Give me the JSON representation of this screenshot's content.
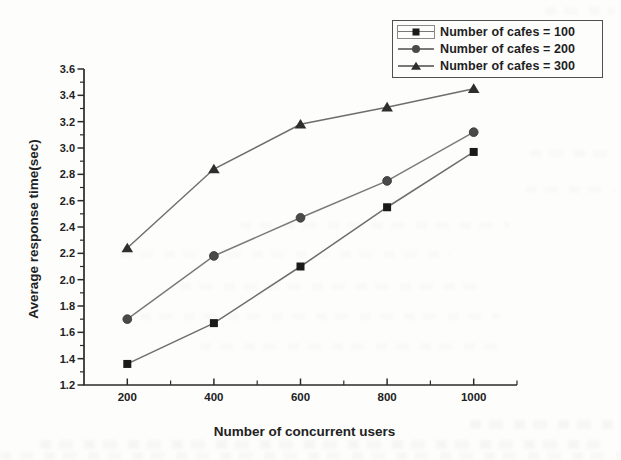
{
  "figure": {
    "background_color": "#fdfdfc",
    "axis_color": "#2b2b2b",
    "line_color": "#6e6e6e",
    "text_color": "#222222"
  },
  "chart_data": {
    "type": "line",
    "title": "",
    "xlabel": "Number of concurrent users",
    "ylabel": "Average response time(sec)",
    "x": [
      200,
      400,
      600,
      800,
      1000
    ],
    "xticks": [
      200,
      400,
      600,
      800,
      1000
    ],
    "xticks_minor": [
      300,
      500,
      700,
      900,
      1100
    ],
    "xlim": [
      100,
      1100
    ],
    "ylim": [
      1.2,
      3.6
    ],
    "ytick_step": 0.2,
    "ytick_minor_step": 0.1,
    "grid": false,
    "legend_position": "top-right",
    "series": [
      {
        "name": "Number of cafes = 100",
        "marker": "square",
        "marker_color": "#1a1a1a",
        "line_color": "#6e6e6e",
        "values": [
          1.36,
          1.67,
          2.1,
          2.55,
          2.97
        ]
      },
      {
        "name": "Number of cafes = 200",
        "marker": "circle",
        "marker_color": "#4a4a4a",
        "line_color": "#7a7a7a",
        "values": [
          1.7,
          2.18,
          2.47,
          2.75,
          3.12
        ]
      },
      {
        "name": "Number of cafes = 300",
        "marker": "triangle",
        "marker_color": "#2e2e2e",
        "line_color": "#6e6e6e",
        "values": [
          2.24,
          2.84,
          3.18,
          3.31,
          3.45
        ]
      }
    ]
  }
}
